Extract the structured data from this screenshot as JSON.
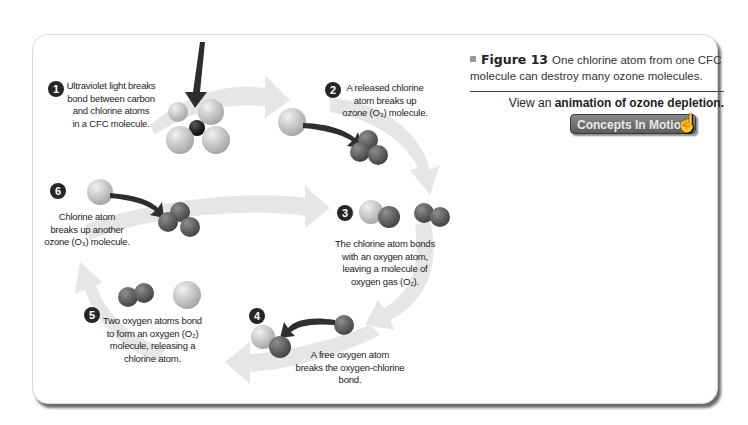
{
  "figure": {
    "label": "Figure 13",
    "caption": "One chlorine atom from one CFC molecule can destroy many ozone molecules.",
    "view_prefix": "View an ",
    "view_link": "animation of ozone depletion.",
    "button_label": "Concepts In Motion",
    "button_icon": "hand-pointer-icon"
  },
  "steps": [
    {
      "number": "1",
      "text": [
        "Ultraviolet light breaks",
        "bond between carbon",
        "and chlorine atoms",
        "in a CFC molecule."
      ]
    },
    {
      "number": "2",
      "text": [
        "A released chlorine",
        "atom breaks up",
        "ozone (O₃) molecule."
      ]
    },
    {
      "number": "3",
      "text": [
        "The chlorine atom bonds",
        "with an oxygen atom,",
        "leaving a molecule of",
        "oxygen gas (O₂)."
      ]
    },
    {
      "number": "4",
      "text": [
        "A free oxygen atom",
        "breaks the oxygen-chlorine",
        "bond."
      ]
    },
    {
      "number": "5",
      "text": [
        "Two oxygen atoms bond",
        "to form an oxygen (O₂)",
        "molecule, releasing a",
        "chlorine atom."
      ]
    },
    {
      "number": "6",
      "text": [
        "Chlorine atom",
        "breaks up another",
        "ozone (O₃) molecule."
      ]
    }
  ],
  "colors": {
    "chlorine": "#c8c8c8",
    "oxygen": "#6a6a6a",
    "carbon": "#1a1a1a",
    "cycle_arrow": "#e6e6e6",
    "badge": "#262626"
  }
}
